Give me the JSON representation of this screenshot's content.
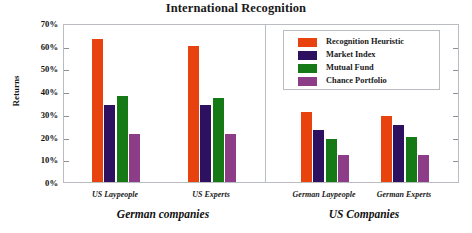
{
  "chart_data": {
    "type": "bar",
    "title": "International Recognition",
    "xlabel": "",
    "ylabel": "Returns",
    "ylim": [
      0,
      70
    ],
    "ytick_labels": [
      "70%",
      "60%",
      "50%",
      "40%",
      "30%",
      "20%",
      "10%",
      "0%"
    ],
    "ytick_values": [
      70,
      60,
      50,
      40,
      30,
      20,
      10,
      0
    ],
    "grid": false,
    "legend_position": "top-right-inside",
    "categories": [
      "US Laypeople",
      "US Experts",
      "German Laypeople",
      "German Experts"
    ],
    "panels": [
      {
        "label": "German companies",
        "categories": [
          "US Laypeople",
          "US Experts"
        ]
      },
      {
        "label": "US Companies",
        "categories": [
          "German Laypeople",
          "German Experts"
        ]
      }
    ],
    "series": [
      {
        "name": "Recognition Heuristic",
        "color": "#e8430f",
        "values": [
          63,
          60,
          31,
          29
        ]
      },
      {
        "name": "Market Index",
        "color": "#2d1060",
        "values": [
          34,
          34,
          23,
          25
        ]
      },
      {
        "name": "Mutual Fund",
        "color": "#157a15",
        "values": [
          38,
          37,
          19,
          20
        ]
      },
      {
        "name": "Chance Portfolio",
        "color": "#8d3d87",
        "values": [
          21,
          21,
          12,
          12
        ]
      }
    ]
  }
}
